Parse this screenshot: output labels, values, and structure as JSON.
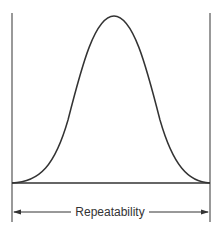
{
  "diagram": {
    "type": "normal-distribution-curve",
    "label": "Repeatability",
    "stroke_color": "#333333",
    "boundary_color": "#666666",
    "elements": [
      "bell-curve",
      "baseline",
      "left-limit-line",
      "right-limit-line",
      "double-arrow-dimension"
    ]
  }
}
